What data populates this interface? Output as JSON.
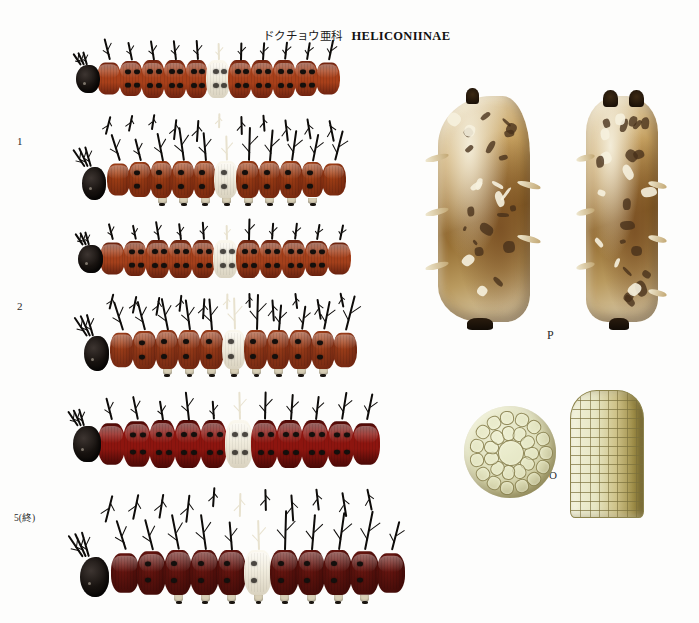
{
  "header": {
    "japanese_name": "ドクチョウ亜科",
    "scientific_name": "HELICONIINAE"
  },
  "labels": {
    "instar_1": "1",
    "instar_2": "2",
    "instar_5_final": "5(終)",
    "pupa": "P",
    "ovum": "O"
  },
  "specimens": [
    {
      "id": "larva-1-dorsal",
      "label": "1",
      "stage": "1st instar larva",
      "view": "dorsal",
      "body_color": "#a8401a",
      "body_color_dark": "#6f2310",
      "spine_color": "#0d0b09",
      "head_color": "#14100d",
      "pale_band_color": "#f1ece0",
      "segments": 11,
      "pale_segment_index": 5
    },
    {
      "id": "larva-1-lateral",
      "label": "1",
      "stage": "1st instar larva",
      "view": "lateral",
      "body_color": "#aa4417",
      "body_color_dark": "#70250e",
      "spine_color": "#0d0b09",
      "head_color": "#14100d",
      "pale_band_color": "#efe9da",
      "segments": 11,
      "pale_segment_index": 5
    },
    {
      "id": "larva-2-dorsal",
      "label": "2",
      "stage": "2nd instar larva",
      "view": "dorsal",
      "body_color": "#a4401b",
      "body_color_dark": "#68220f",
      "spine_color": "#0c0a08",
      "head_color": "#13100c",
      "pale_band_color": "#efe9d8",
      "segments": 11,
      "pale_segment_index": 5
    },
    {
      "id": "larva-2-lateral",
      "label": "2",
      "stage": "2nd instar larva",
      "view": "lateral",
      "body_color": "#a8441c",
      "body_color_dark": "#6c2410",
      "spine_color": "#0c0a08",
      "head_color": "#13100c",
      "pale_band_color": "#ece5d2",
      "segments": 11,
      "pale_segment_index": 5
    },
    {
      "id": "larva-5-dorsal",
      "label": "5(終)",
      "stage": "5th (final) instar larva",
      "view": "dorsal",
      "body_color": "#8d150f",
      "body_color_dark": "#4a0906",
      "spine_color": "#0a0807",
      "head_color": "#160d0a",
      "pale_band_color": "#eae6d6",
      "segments": 11,
      "pale_segment_index": 5
    },
    {
      "id": "larva-5-lateral",
      "label": "5(終)",
      "stage": "5th (final) instar larva",
      "view": "lateral",
      "body_color": "#6f1711",
      "body_color_dark": "#3d0a07",
      "spine_color": "#0a0807",
      "head_color": "#1b100b",
      "pale_band_color": "#f1ede0",
      "segments": 11,
      "pale_segment_index": 5
    },
    {
      "id": "pupa-lateral",
      "label": "P",
      "stage": "pupa",
      "view": "lateral",
      "base_color": "#c9a463",
      "light_color": "#efe8d2",
      "dark_color": "#4a3318"
    },
    {
      "id": "pupa-dorsal",
      "label": "P",
      "stage": "pupa",
      "view": "dorsal",
      "base_color": "#c09a5a",
      "light_color": "#f2ecd8",
      "dark_color": "#3e2a12"
    },
    {
      "id": "egg-top",
      "label": "O",
      "stage": "ovum",
      "view": "apical",
      "base_color": "#dfe0bd",
      "outline_color": "#8a8250"
    },
    {
      "id": "egg-lateral",
      "label": "O",
      "stage": "ovum",
      "view": "lateral",
      "base_color": "#e7e6c3",
      "outline_color": "#8c834b"
    }
  ],
  "background_color": "#fdfdfc"
}
